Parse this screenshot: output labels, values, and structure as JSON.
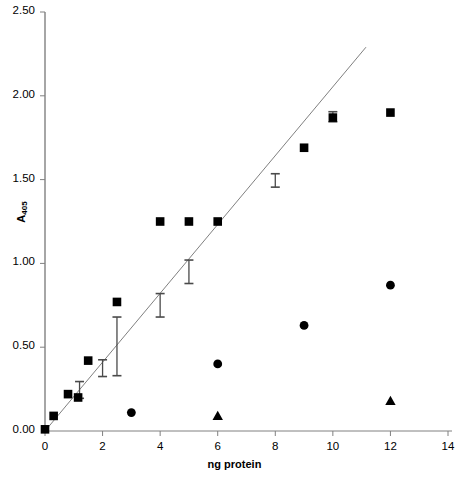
{
  "chart_data": {
    "type": "scatter",
    "title": "",
    "xlabel": "ng protein",
    "ylabel": "A405",
    "ylabel_base": "A",
    "ylabel_sub": "405",
    "xlim": [
      0,
      14
    ],
    "ylim": [
      0.0,
      2.5
    ],
    "xticks": [
      0,
      2,
      4,
      6,
      8,
      10,
      12,
      14
    ],
    "xtick_labels": [
      "0",
      "2",
      "4",
      "6",
      "8",
      "10",
      "12",
      "14"
    ],
    "yticks": [
      0.0,
      0.5,
      1.0,
      1.5,
      2.0,
      2.5
    ],
    "ytick_labels": [
      "0.00",
      "0.50",
      "1.00",
      "1.50",
      "2.00",
      "2.50"
    ],
    "grid": false,
    "legend": "none",
    "marker_color": "#000000",
    "axis_color": "#808080",
    "line_color": "#808080",
    "series": [
      {
        "name": "squares",
        "marker": "square",
        "x": [
          0.0,
          0.3,
          0.8,
          1.15,
          1.5,
          2.5,
          4.0,
          5.0,
          6.0,
          9.0,
          10.0,
          12.0
        ],
        "y": [
          0.01,
          0.09,
          0.22,
          0.2,
          0.42,
          0.77,
          1.25,
          1.25,
          1.25,
          1.69,
          1.87,
          1.9
        ]
      },
      {
        "name": "circles",
        "marker": "circle",
        "x": [
          3.0,
          6.0,
          9.0,
          12.0
        ],
        "y": [
          0.11,
          0.4,
          0.63,
          0.87
        ]
      },
      {
        "name": "triangles",
        "marker": "triangle",
        "x": [
          6.0,
          12.0
        ],
        "y": [
          0.09,
          0.18
        ]
      }
    ],
    "fit_line": {
      "name": "regression-line",
      "x0": 0.0,
      "y0": 0.0,
      "x1": 11.15,
      "y1": 2.29
    },
    "error_bars": [
      {
        "x": 1.2,
        "y": 0.245,
        "low": 0.195,
        "high": 0.295
      },
      {
        "x": 2.0,
        "y": 0.375,
        "low": 0.325,
        "high": 0.425
      },
      {
        "x": 2.5,
        "y": 0.505,
        "low": 0.33,
        "high": 0.68
      },
      {
        "x": 4.0,
        "y": 0.75,
        "low": 0.68,
        "high": 0.82
      },
      {
        "x": 5.0,
        "y": 0.95,
        "low": 0.88,
        "high": 1.02
      },
      {
        "x": 8.0,
        "y": 1.495,
        "low": 1.455,
        "high": 1.535
      },
      {
        "x": 10.0,
        "y": 1.875,
        "low": 1.845,
        "high": 1.905
      }
    ]
  }
}
